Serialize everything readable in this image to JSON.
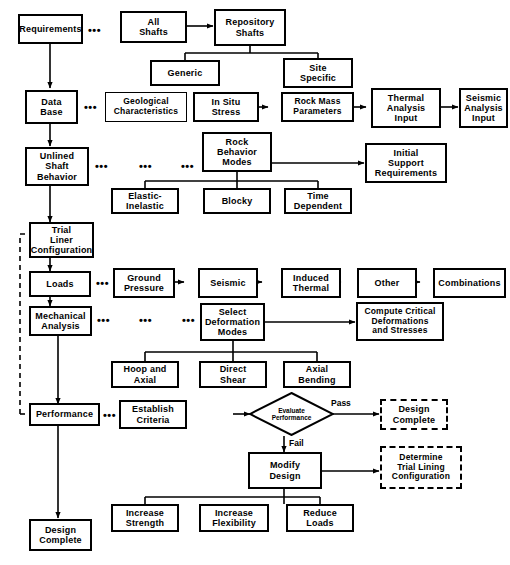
{
  "diagram": {
    "nodes": {
      "requirements": "Requirements",
      "all_shafts": "All\nShafts",
      "repository_shafts": "Repository\nShafts",
      "generic": "Generic",
      "site_specific": "Site\nSpecific",
      "data_base": "Data\nBase",
      "geological_characteristics": "Geological\nCharacteristics",
      "in_situ_stress": "In Situ\nStress",
      "rock_mass_parameters": "Rock Mass\nParameters",
      "thermal_analysis_input": "Thermal\nAnalysis\nInput",
      "seismic_analysis_input": "Seismic\nAnalysis\nInput",
      "unlined_shaft_behavior": "Unlined\nShaft\nBehavior",
      "rock_behavior_modes": "Rock\nBehavior\nModes",
      "initial_support_requirements": "Initial\nSupport\nRequirements",
      "elastic_inelastic": "Elastic-\nInelastic",
      "blocky": "Blocky",
      "time_dependent": "Time\nDependent",
      "trial_liner_configuration": "Trial\nLiner\nConfiguration",
      "loads": "Loads",
      "ground_pressure": "Ground\nPressure",
      "seismic": "Seismic",
      "induced_thermal": "Induced\nThermal",
      "other": "Other",
      "combinations": "Combinations",
      "mechanical_analysis": "Mechanical\nAnalysis",
      "select_deformation_modes": "Select\nDeformation\nModes",
      "compute_critical": "Compute Critical\nDeformations\nand Stresses",
      "hoop_and_axial": "Hoop and\nAxial",
      "direct_shear": "Direct\nShear",
      "axial_bending": "Axial\nBending",
      "performance": "Performance",
      "establish_criteria": "Establish\nCriteria",
      "evaluate_performance": "Evaluate\nPerformance",
      "design_complete_right": "Design\nComplete",
      "modify_design": "Modify\nDesign",
      "determine_trial_lining": "Determine\nTrial Lining\nConfiguration",
      "increase_strength": "Increase\nStrength",
      "increase_flexibility": "Increase\nFlexibility",
      "reduce_loads": "Reduce\nLoads",
      "design_complete_bottom": "Design\nComplete"
    },
    "edge_labels": {
      "pass": "Pass",
      "fail": "Fail"
    },
    "ellipsis": "•••",
    "colors": {
      "stroke": "#000000",
      "background": "#ffffff",
      "text": "#000000"
    }
  }
}
